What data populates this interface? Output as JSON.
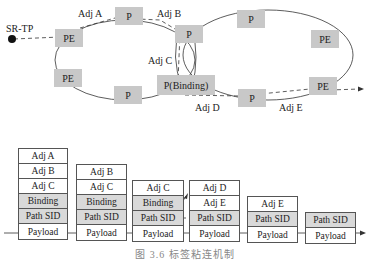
{
  "topology": {
    "source_label": "SR-TP",
    "nodes": [
      {
        "id": "pe1",
        "label": "PE"
      },
      {
        "id": "p1",
        "label": "P"
      },
      {
        "id": "p2",
        "label": "P"
      },
      {
        "id": "p3",
        "label": "P"
      },
      {
        "id": "pe2",
        "label": "PE"
      },
      {
        "id": "pe3",
        "label": "PE"
      },
      {
        "id": "pe4",
        "label": "PE"
      },
      {
        "id": "p4",
        "label": "P"
      },
      {
        "id": "pbind",
        "label": "P(Binding)"
      },
      {
        "id": "p5",
        "label": "P"
      }
    ],
    "adjacency_labels": [
      "Adj A",
      "Adj B",
      "Adj C",
      "Adj D",
      "Adj E"
    ]
  },
  "stacks": [
    {
      "cells": [
        "Adj A",
        "Adj B",
        "Adj C",
        "Binding",
        "Path SID",
        "Payload"
      ]
    },
    {
      "cells": [
        "Adj B",
        "Adj C",
        "Binding",
        "Path SID",
        "Payload"
      ]
    },
    {
      "cells": [
        "Adj C",
        "Binding",
        "Path SID",
        "Payload"
      ]
    },
    {
      "cells": [
        "Adj D",
        "Adj E",
        "Path SID",
        "Payload"
      ]
    },
    {
      "cells": [
        "Adj E",
        "Path SID",
        "Payload"
      ]
    },
    {
      "cells": [
        "Path SID",
        "Payload"
      ]
    }
  ],
  "caption": "图 3.6   标签粘连机制"
}
